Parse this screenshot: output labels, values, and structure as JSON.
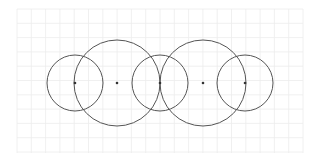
{
  "diagram": {
    "background": "#ffffff",
    "grid": {
      "x0": 17,
      "y0": 9,
      "x1": 303,
      "y1": 153,
      "spacing": 14.3,
      "color": "#ececec"
    },
    "stroke_color": "#555555",
    "point_color": "#333333",
    "circles": [
      {
        "id": "small-left",
        "cx": 75,
        "cy": 83,
        "r": 28,
        "center_dot": true
      },
      {
        "id": "large-left",
        "cx": 117,
        "cy": 83,
        "r": 43,
        "center_dot": true
      },
      {
        "id": "small-middle",
        "cx": 160,
        "cy": 83,
        "r": 28,
        "center_dot": true
      },
      {
        "id": "large-right",
        "cx": 203,
        "cy": 83,
        "r": 43,
        "center_dot": true
      },
      {
        "id": "small-right",
        "cx": 245,
        "cy": 83,
        "r": 28,
        "center_dot": true
      }
    ]
  }
}
